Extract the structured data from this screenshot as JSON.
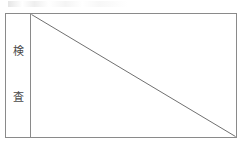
{
  "page": {
    "background_color": "#ffffff",
    "width": 246,
    "height": 147
  },
  "table": {
    "border_color": "#8a8a8a",
    "label_column": {
      "name": "検査",
      "meaning_label": "検査",
      "characters": [
        {
          "char": "検"
        },
        {
          "char": "査"
        }
      ]
    },
    "content_cell": {
      "text": "",
      "mark": "diagonal-strike",
      "mark_color": "#6f6f6f",
      "mark_from": "top-left",
      "mark_to": "bottom-right"
    }
  }
}
